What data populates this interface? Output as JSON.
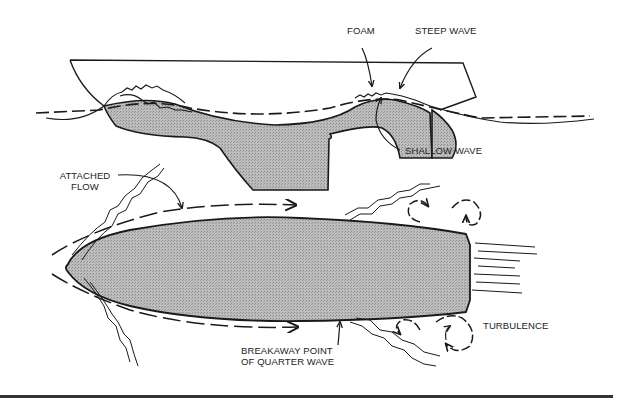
{
  "figure": {
    "side_view": {
      "labels": {
        "foam": "FOAM",
        "steep_wave": "STEEP WAVE",
        "shallow_wave": "SHALLOW WAVE"
      }
    },
    "plan_view": {
      "labels": {
        "attached_flow_line1": "ATTACHED",
        "attached_flow_line2": "FLOW",
        "turbulence": "TURBULENCE",
        "breakaway_line1": "BREAKAWAY POINT",
        "breakaway_line2": "OF QUARTER WAVE"
      }
    }
  },
  "colors": {
    "ink": "#1a1a1a",
    "hull_fill": "#b5b5b5",
    "rule": "#333333",
    "background": "#ffffff"
  }
}
